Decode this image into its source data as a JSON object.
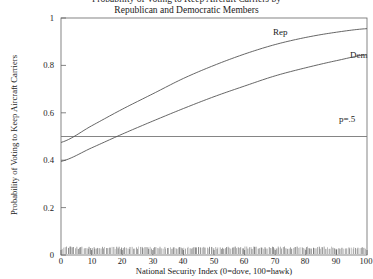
{
  "chart_data": {
    "type": "line",
    "title": "Republican and Democratic Members",
    "title_cut_off": "Probability of Voting to Keep Aircraft Carriers by",
    "xlabel": "National Security Index (0=dove, 100=hawk)",
    "ylabel": "Probability of Voting to Keep Aircraft Carriers",
    "xlim": [
      0,
      100
    ],
    "ylim": [
      0,
      1
    ],
    "grid": false,
    "legend_position": "inline-labels",
    "x_ticks": [
      "0",
      "10",
      "20",
      "30",
      "40",
      "50",
      "60",
      "70",
      "80",
      "90",
      "100"
    ],
    "x_tick_values": [
      0,
      10,
      20,
      30,
      40,
      50,
      60,
      70,
      80,
      90,
      100
    ],
    "y_ticks": [
      "0",
      "0.2",
      "0.4",
      "0.6",
      "0.8",
      "1"
    ],
    "y_tick_values": [
      0,
      0.2,
      0.4,
      0.6,
      0.8,
      1
    ],
    "x": [
      0,
      10,
      20,
      30,
      40,
      50,
      60,
      70,
      80,
      90,
      100
    ],
    "series": [
      {
        "name": "Rep",
        "label": "Rep",
        "color": "#555555",
        "values": [
          0.475,
          0.545,
          0.615,
          0.68,
          0.745,
          0.8,
          0.848,
          0.888,
          0.918,
          0.94,
          0.955
        ]
      },
      {
        "name": "Dem",
        "label": "Dem",
        "color": "#555555",
        "values": [
          0.395,
          0.452,
          0.51,
          0.565,
          0.618,
          0.668,
          0.713,
          0.756,
          0.79,
          0.82,
          0.845
        ]
      }
    ],
    "reference_lines": [
      {
        "name": "p=.5",
        "label": "p=.5",
        "y": 0.5,
        "color": "#777777"
      }
    ],
    "rug": {
      "name": "rug-plot",
      "position": "bottom",
      "description": "dense strip of observation tick marks along the x-axis baseline"
    },
    "annotations": [
      {
        "name": "rep-curve-label",
        "text": "Rep",
        "x": 70,
        "y": 0.93
      },
      {
        "name": "dem-curve-label",
        "text": "Dem",
        "x": 96,
        "y": 0.82
      },
      {
        "name": "p-half-label",
        "text": "p=.5",
        "x": 93,
        "y": 0.55
      }
    ]
  }
}
